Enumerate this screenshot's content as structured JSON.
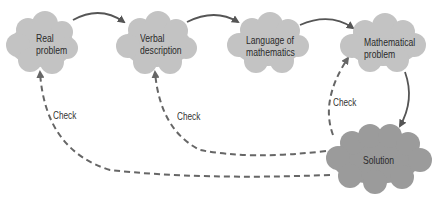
{
  "nodes": [
    {
      "id": "real",
      "line1": "Real",
      "line2": "problem"
    },
    {
      "id": "verbal",
      "line1": "Verbal",
      "line2": "description"
    },
    {
      "id": "language",
      "line1": "Language of",
      "line2": "mathematics"
    },
    {
      "id": "mathematical",
      "line1": "Mathematical",
      "line2": "problem"
    },
    {
      "id": "solution",
      "line1": "Solution"
    }
  ],
  "edges": {
    "check_label_1": "Check",
    "check_label_2": "Check",
    "check_label_3": "Check"
  },
  "colors": {
    "cloud": "#c3c3c3",
    "solution_cloud": "#9b9b9b",
    "arrow": "#555555",
    "dashed": "#666666"
  }
}
